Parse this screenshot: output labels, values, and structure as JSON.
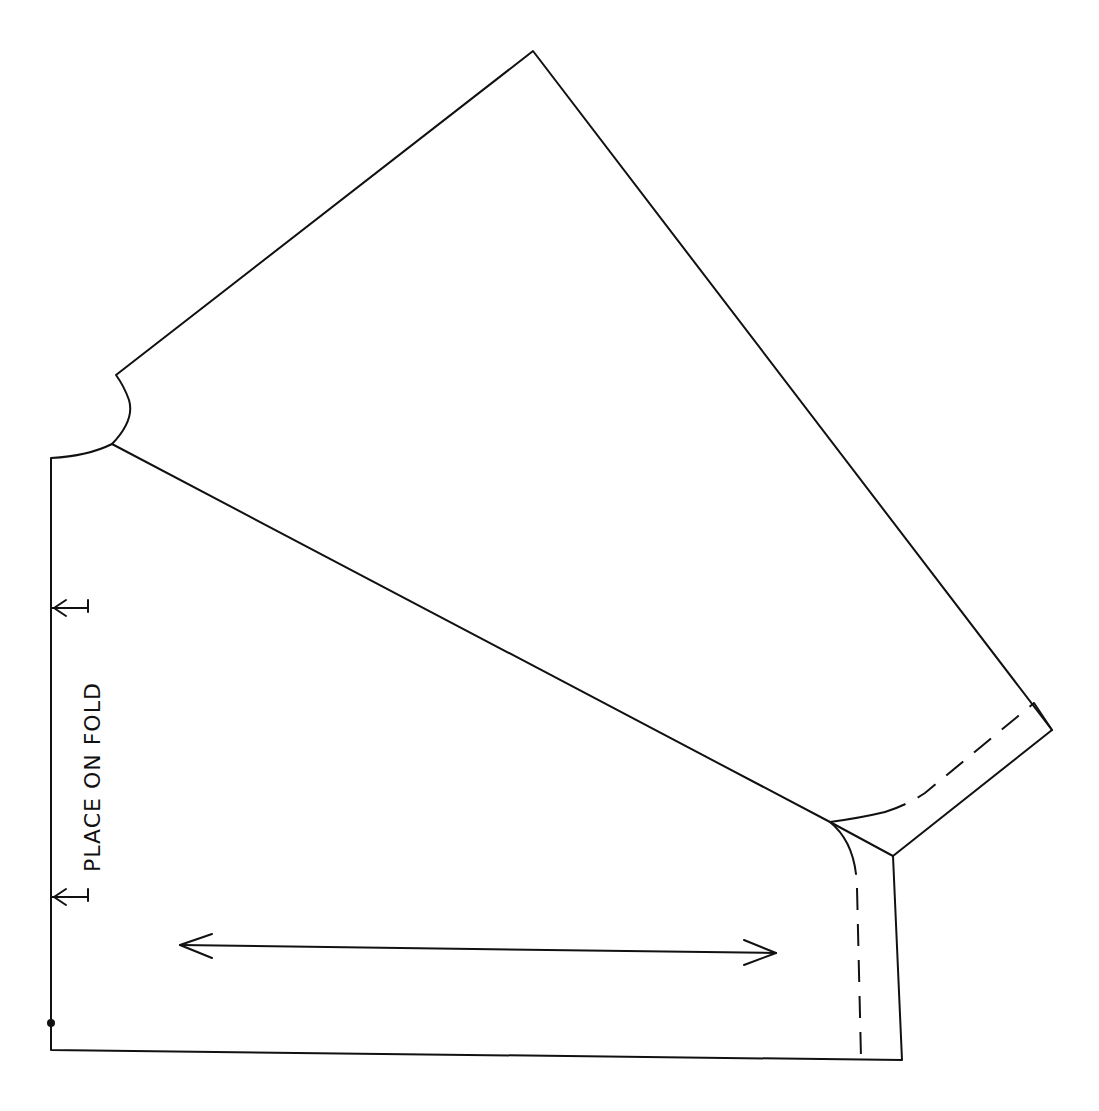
{
  "diagram": {
    "type": "sewing-pattern-piece",
    "labels": {
      "fold_instruction": "PLACE ON FOLD"
    },
    "colors": {
      "stroke": "#111111",
      "background": "#ffffff"
    },
    "annotations": [
      {
        "kind": "fold-arrow-top",
        "position": [
          60,
          608
        ]
      },
      {
        "kind": "fold-arrow-bottom",
        "position": [
          60,
          897
        ]
      },
      {
        "kind": "grainline-arrow",
        "from": [
          178,
          948
        ],
        "to": [
          778,
          955
        ]
      },
      {
        "kind": "notch-dot",
        "position": [
          51,
          1023
        ]
      },
      {
        "kind": "cuff-hemline-dashed"
      },
      {
        "kind": "side-seam-dashed"
      }
    ]
  }
}
